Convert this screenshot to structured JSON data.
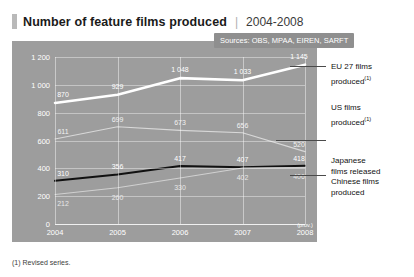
{
  "header": {
    "title": "Number of feature films produced",
    "separator": "|",
    "period": "2004-2008"
  },
  "sources": {
    "text": "Sources: OBS, MPAA, EIREN, SARFT"
  },
  "footnote": {
    "text": "(1) Revised series."
  },
  "legend": {
    "items": [
      {
        "label_line1": "EU 27 films",
        "label_line2": "produced",
        "footnote_marker": "(1)",
        "color": "#ffffff"
      },
      {
        "label_line1": "US films",
        "label_line2": "produced",
        "footnote_marker": "(1)",
        "color": "#d6d6d6"
      },
      {
        "label_line1": "Japanese",
        "label_line2": "films released",
        "footnote_marker": "",
        "color": "#1a1a1a"
      },
      {
        "label_line1": "Chinese films",
        "label_line2": "produced",
        "footnote_marker": "",
        "color": "#cccccc"
      }
    ]
  },
  "chart_data": {
    "type": "line",
    "title": "Number of feature films produced",
    "subtitle": "2004-2008",
    "xlabel": "",
    "ylabel": "",
    "categories": [
      "2004",
      "2005",
      "2006",
      "2007",
      "2008"
    ],
    "x_annotations": {
      "2008": "(prov.)"
    },
    "ylim": [
      0,
      1200
    ],
    "yticks": [
      0,
      200,
      400,
      600,
      800,
      1000,
      1200
    ],
    "ytick_labels": [
      "0",
      "200",
      "400",
      "600",
      "800",
      "1 000",
      "1 200"
    ],
    "grid": true,
    "legend_position": "right",
    "series": [
      {
        "name": "EU 27 films produced",
        "color": "#ffffff",
        "values": [
          870,
          929,
          1048,
          1033,
          1145
        ],
        "labels": [
          "870",
          "929",
          "1 048",
          "1 033",
          "1 145"
        ]
      },
      {
        "name": "US films produced",
        "color": "#d8d8d8",
        "values": [
          611,
          699,
          673,
          656,
          520
        ],
        "labels": [
          "611",
          "699",
          "673",
          "656",
          "520"
        ]
      },
      {
        "name": "Japanese films released",
        "color": "#111111",
        "values": [
          310,
          356,
          417,
          407,
          418
        ],
        "labels": [
          "310",
          "356",
          "417",
          "407",
          "418"
        ]
      },
      {
        "name": "Chinese films produced",
        "color": "#d0d0d0",
        "values": [
          212,
          260,
          330,
          402,
          406
        ],
        "labels": [
          "212",
          "260",
          "330",
          "402",
          "406"
        ]
      }
    ]
  }
}
